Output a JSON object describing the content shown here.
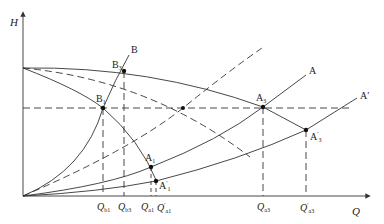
{
  "diagram": {
    "type": "pump-system-characteristic-curves",
    "axes": {
      "y_label": "H",
      "x_label": "Q"
    },
    "curves": [
      {
        "id": "pump-full",
        "style": "solid",
        "description": "upper pump H-Q curve"
      },
      {
        "id": "pump-reduced-dashed",
        "style": "dashed",
        "description": "reduced pump curve"
      },
      {
        "id": "pump-lower",
        "style": "solid",
        "description": "lower pump curve through B1 and A1"
      },
      {
        "id": "system-B",
        "style": "solid",
        "label": "B"
      },
      {
        "id": "system-mid-dashed",
        "style": "dashed",
        "description": "intermediate system curve"
      },
      {
        "id": "system-A",
        "style": "solid",
        "label": "A"
      },
      {
        "id": "system-A-prime",
        "style": "solid",
        "label": "A′"
      }
    ],
    "points": {
      "B1": {
        "main": "B",
        "sub": "1",
        "prime": ""
      },
      "B3": {
        "main": "B",
        "sub": "3",
        "prime": ""
      },
      "A1": {
        "main": "A",
        "sub": "1",
        "prime": ""
      },
      "A1p": {
        "main": "A",
        "sub": "1",
        "prime": "′"
      },
      "A3": {
        "main": "A",
        "sub": "3",
        "prime": ""
      },
      "A3p": {
        "main": "A",
        "sub": "3",
        "prime": "′"
      }
    },
    "curve_labels": {
      "B": "B",
      "A": "A",
      "A_prime": "A′"
    },
    "x_ticks": [
      {
        "main": "Q",
        "sub": "b1",
        "prime": ""
      },
      {
        "main": "Q",
        "sub": "b3",
        "prime": ""
      },
      {
        "main": "Q",
        "sub": "a1",
        "prime": ""
      },
      {
        "main": "Q",
        "sub": "a1",
        "prime": "′"
      },
      {
        "main": "Q",
        "sub": "a3",
        "prime": ""
      },
      {
        "main": "Q",
        "sub": "a3",
        "prime": "′"
      }
    ],
    "colors": {
      "line": "#333333",
      "background": "#ffffff"
    }
  }
}
